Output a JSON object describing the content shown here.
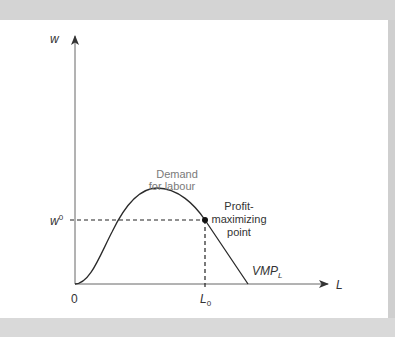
{
  "diagram": {
    "title": "Demand for labour",
    "axes": {
      "y_label": "w",
      "x_label": "L",
      "origin_label": "0"
    },
    "levels": {
      "wage_label": "w",
      "wage_superscript": "0",
      "labour_label": "L",
      "labour_subscript": "0"
    },
    "curve": {
      "name_main": "VMP",
      "name_sub": "L"
    },
    "annotations": {
      "demand_line1": "Demand",
      "demand_line2": "for labour",
      "profit_line1": "Profit-",
      "profit_line2": "maximizing",
      "profit_line3": "point"
    },
    "colors": {
      "background": "#d9d9d9",
      "panel": "#ffffff",
      "axis": "#555555",
      "curve": "#2a2a2a",
      "annotation": "#7a7a7a"
    }
  }
}
